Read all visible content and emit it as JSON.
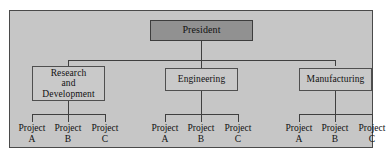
{
  "chart": {
    "type": "org-chart",
    "panel": {
      "background_color": "#c6c6c6",
      "border_color": "#4a4a4a"
    },
    "colors": {
      "root_fill": "#919191",
      "department_fill": "#c9c9c9",
      "box_border": "#4f4f4f",
      "connector": "#3f3f3f",
      "text": "#111111",
      "page_background": "#ffffff"
    },
    "root": {
      "label": "President"
    },
    "departments": [
      {
        "label": "Research\nand\nDevelopment",
        "projects": [
          {
            "label": "Project\nA"
          },
          {
            "label": "Project\nB"
          },
          {
            "label": "Project\nC"
          }
        ]
      },
      {
        "label": "Engineering",
        "projects": [
          {
            "label": "Project\nA"
          },
          {
            "label": "Project\nB"
          },
          {
            "label": "Project\nC"
          }
        ]
      },
      {
        "label": "Manufacturing",
        "projects": [
          {
            "label": "Project\nA"
          },
          {
            "label": "Project\nB"
          },
          {
            "label": "Project\nC"
          }
        ]
      }
    ]
  }
}
